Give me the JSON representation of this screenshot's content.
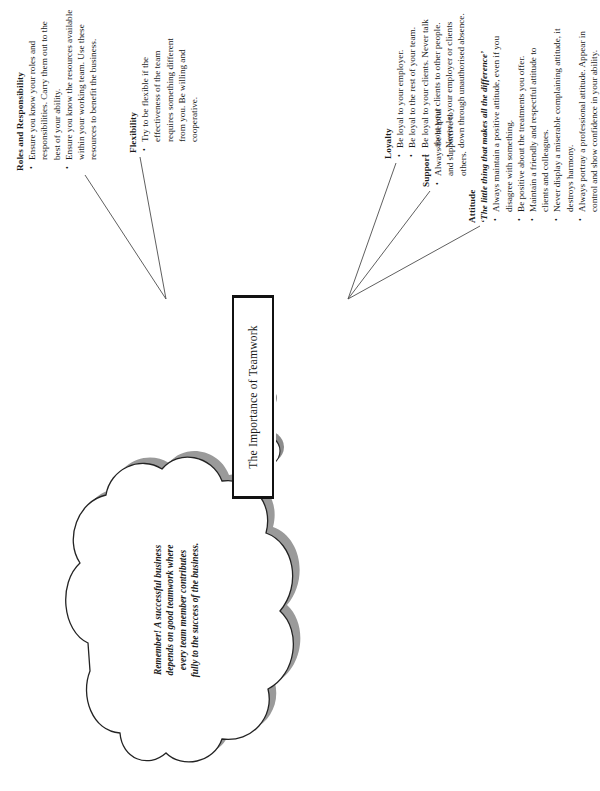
{
  "diagram": {
    "type": "mind-map",
    "center": {
      "label": "The Importance of Teamwork"
    },
    "cloud": {
      "text": "Remember! A successful business depends on good teamwork where every team member contributes fully to the success of the business.",
      "lines": [
        "Remember! A successful business",
        "depends on good teamwork where",
        "every team member contributes",
        "fully to the success of the business."
      ]
    },
    "branches": [
      {
        "id": "roles",
        "title": "Roles and Responsibility",
        "subtitle": "",
        "bullets": [
          "Ensure you know your roles and responsibilities. Carry them out to the best of your ability.",
          "Ensure you know the resources available within your working team. Use these resources to benefit the business."
        ]
      },
      {
        "id": "flexibility",
        "title": "Flexibility",
        "subtitle": "",
        "bullets": [
          "Try to be flexible if the effectiveness of the team requires something different from you. Be willing and cooperative."
        ]
      },
      {
        "id": "loyalty",
        "title": "Loyalty",
        "subtitle": "",
        "bullets": [
          "Be loyal to your employer.",
          "Be loyal to the rest of your team.",
          "Be loyal to your clients. Never talk about your clients to other people.",
          "Never let your employer or clients down through unauthorised absence."
        ]
      },
      {
        "id": "support",
        "title": "Support",
        "subtitle": "",
        "bullets": [
          "Always be helpful and supportive to others."
        ]
      },
      {
        "id": "attitude",
        "title": "Attitude",
        "subtitle": "‘The little thing that makes all the difference’",
        "bullets": [
          "Always maintain a positive attitude, even if you disagree with something.",
          "Be positive about the treatments you offer.",
          "Maintain a friendly and respectful attitude to clients and colleagues.",
          "Never display a miserable complaining attitude, it destroys harmony.",
          "Always portray a professional attitude. Appear in control and show confidence in your ability."
        ]
      }
    ],
    "colors": {
      "ink": "#1a1a1a",
      "line": "#555555",
      "shadow": "#888888",
      "background": "#ffffff"
    }
  }
}
